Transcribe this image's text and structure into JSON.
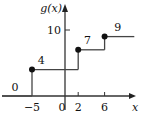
{
  "chart_data": {
    "type": "line",
    "subtype": "step-function",
    "title": "",
    "ylabel": "g(x)",
    "xlabel": "x",
    "xlim": [
      -10,
      11.5
    ],
    "ylim": [
      -2,
      14
    ],
    "x_ticks": [
      {
        "value": -5,
        "label": "−5"
      },
      {
        "value": 0,
        "label": "0"
      },
      {
        "value": 2,
        "label": "2"
      },
      {
        "value": 6,
        "label": "6"
      }
    ],
    "y_ticks": [
      {
        "value": 10,
        "label": "10"
      }
    ],
    "segments": [
      {
        "x_start": -10,
        "x_end": -5,
        "y": 0,
        "label": "0",
        "closed_start": false
      },
      {
        "x_start": -5,
        "x_end": 2,
        "y": 4,
        "label": "4",
        "closed_start": true
      },
      {
        "x_start": 2,
        "x_end": 6,
        "y": 7,
        "label": "7",
        "closed_start": true
      },
      {
        "x_start": 6,
        "x_end": 10.5,
        "y": 9,
        "label": "9",
        "closed_start": true
      }
    ],
    "grid": false,
    "legend": "none"
  }
}
